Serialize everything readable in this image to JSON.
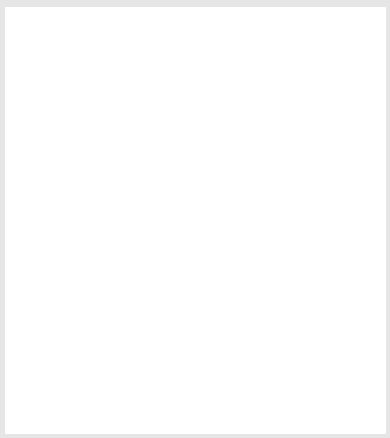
{
  "diagram": {
    "type": "tree",
    "nodes": [
      {
        "id": "Z",
        "label": "Z",
        "style": "root"
      },
      {
        "id": "W",
        "label": "W",
        "parent": "Z"
      },
      {
        "id": "U",
        "label": "U",
        "parent": "Z"
      },
      {
        "id": "S",
        "label": "S",
        "parent": "W"
      },
      {
        "id": "R",
        "label": "R",
        "parent": "W"
      },
      {
        "id": "Q",
        "label": "Q",
        "parent": "U"
      },
      {
        "id": "T",
        "label": "T",
        "parent": "U"
      },
      {
        "id": "K1-5",
        "base": "K",
        "from": "1",
        "to": "5",
        "parent": "S"
      },
      {
        "id": "J6-10",
        "base": "J",
        "from": "6",
        "to": "10",
        "parent": "R"
      },
      {
        "id": "J1-5",
        "base": "J",
        "from": "1",
        "to": "5",
        "parent": "Q"
      },
      {
        "id": "K6-10",
        "base": "K",
        "from": "6",
        "to": "10",
        "parent": "T"
      },
      {
        "id": "J1-10",
        "base": "J",
        "from": "1",
        "to": "10",
        "merge_of": [
          "J6-10",
          "J1-5"
        ]
      },
      {
        "id": "G1-10",
        "base": "G",
        "from": "1",
        "to": "10",
        "parent": "J1-10"
      },
      {
        "id": "H1-10",
        "base": "H",
        "from": "1",
        "to": "10",
        "parent": "J1-10"
      },
      {
        "id": "C1-10",
        "base": "C",
        "from": "1",
        "to": "10",
        "parent": "G1-10"
      },
      {
        "id": "F1-10",
        "base": "F",
        "from": "1",
        "to": "10",
        "parent": "G1-10"
      },
      {
        "id": "D1-10",
        "base": "D",
        "from": "1",
        "to": "10",
        "parent": "F1-10"
      },
      {
        "id": "E1-10",
        "base": "E",
        "from": "1",
        "to": "10",
        "parent": "F1-10"
      }
    ],
    "ellipsis": "...",
    "colors": {
      "node_fill": "#dedede",
      "root_fill": "#ffffff",
      "border": "#6e6e6e",
      "line": "#555555",
      "frame": "#e6e6e6"
    }
  }
}
